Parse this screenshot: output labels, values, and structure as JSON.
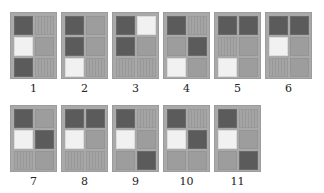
{
  "figure": {
    "colors": {
      "dark": "#5b5b5b",
      "white": "#f1f1f1",
      "medium": "#9d9d9d",
      "hatched": "#a4a4a4",
      "frame": "#a9a9a9"
    },
    "tiles": [
      {
        "label": "1",
        "cells": [
          [
            "dark",
            "hatched"
          ],
          [
            "white",
            "medium"
          ],
          [
            "dark",
            "hatched"
          ]
        ]
      },
      {
        "label": "2",
        "cells": [
          [
            "dark",
            "medium"
          ],
          [
            "dark",
            "medium"
          ],
          [
            "white",
            "hatched"
          ]
        ]
      },
      {
        "label": "3",
        "cells": [
          [
            "dark",
            "white"
          ],
          [
            "dark",
            "medium"
          ],
          [
            "hatched",
            "hatched"
          ]
        ]
      },
      {
        "label": "4",
        "cells": [
          [
            "dark",
            "hatched"
          ],
          [
            "medium",
            "dark"
          ],
          [
            "white",
            "medium"
          ]
        ]
      },
      {
        "label": "5",
        "cells": [
          [
            "dark",
            "dark"
          ],
          [
            "hatched",
            "medium"
          ],
          [
            "white",
            "medium"
          ]
        ]
      },
      {
        "label": "6",
        "cells": [
          [
            "dark",
            "dark"
          ],
          [
            "white",
            "medium"
          ],
          [
            "hatched",
            "medium"
          ]
        ]
      },
      {
        "label": "7",
        "cells": [
          [
            "dark",
            "medium"
          ],
          [
            "white",
            "dark"
          ],
          [
            "hatched",
            "medium"
          ]
        ]
      },
      {
        "label": "8",
        "cells": [
          [
            "dark",
            "dark"
          ],
          [
            "white",
            "medium"
          ],
          [
            "hatched",
            "hatched"
          ]
        ]
      },
      {
        "label": "9",
        "cells": [
          [
            "dark",
            "hatched"
          ],
          [
            "white",
            "medium"
          ],
          [
            "medium",
            "dark"
          ]
        ]
      },
      {
        "label": "10",
        "cells": [
          [
            "dark",
            "hatched"
          ],
          [
            "white",
            "dark"
          ],
          [
            "medium",
            "medium"
          ]
        ]
      },
      {
        "label": "11",
        "cells": [
          [
            "dark",
            "hatched"
          ],
          [
            "white",
            "medium"
          ],
          [
            "medium",
            "dark"
          ]
        ]
      }
    ]
  }
}
